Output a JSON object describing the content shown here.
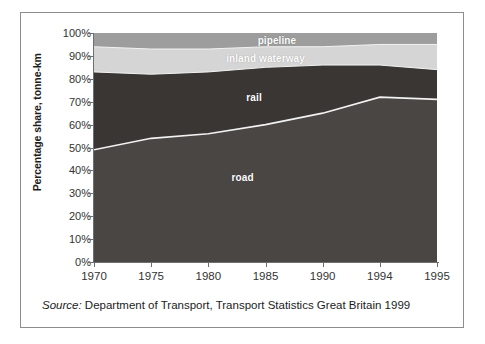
{
  "figure": {
    "background": "#ffffff",
    "frame_color": "#8d8d8d"
  },
  "axis": {
    "ylabel": "Percentage share, tonne-km",
    "ytick_labels": [
      "0%",
      "10%",
      "20%",
      "30%",
      "40%",
      "50%",
      "60%",
      "70%",
      "80%",
      "90%",
      "100%"
    ],
    "xtick_labels": [
      "1970",
      "1975",
      "1980",
      "1985",
      "1990",
      "1994",
      "1995"
    ]
  },
  "series_labels": {
    "pipeline": "pipeline",
    "waterway": "inland waterway",
    "rail": "rail",
    "road": "road"
  },
  "source": {
    "prefix": "Source:",
    "text": "Department of Transport, Transport Statistics Great Britain 1999"
  },
  "colors": {
    "road": "#4a4644",
    "rail": "#3a3634",
    "waterway": "#d5d5d5",
    "pipeline": "#9d9d9d",
    "boundary_line": "#f2f2f2",
    "axis": "#6f6f6f",
    "text": "#333333"
  },
  "chart_data": {
    "type": "area",
    "title": "",
    "subtitle": "",
    "xlabel": "",
    "ylabel": "Percentage share, tonne-km",
    "categories": [
      "1970",
      "1975",
      "1980",
      "1985",
      "1990",
      "1994",
      "1995"
    ],
    "x_spacing": "equal",
    "ylim": [
      0,
      100
    ],
    "yticks": [
      0,
      10,
      20,
      30,
      40,
      50,
      60,
      70,
      80,
      90,
      100
    ],
    "ytick_format": "percent",
    "grid": false,
    "legend": "inline-labels",
    "stacked": true,
    "stack_total": 100,
    "series": [
      {
        "name": "road",
        "color": "#4a4644",
        "values": [
          49,
          54,
          56,
          60,
          65,
          72,
          71
        ],
        "cumulative_top": [
          49,
          54,
          56,
          60,
          65,
          72,
          71
        ],
        "label_position": {
          "x": "1983",
          "y": 37
        }
      },
      {
        "name": "rail",
        "color": "#3a3634",
        "values": [
          34,
          28,
          27,
          25,
          21,
          14,
          13
        ],
        "cumulative_top": [
          83,
          82,
          83,
          85,
          86,
          86,
          84
        ],
        "label_position": {
          "x": "1984",
          "y": 72
        }
      },
      {
        "name": "inland waterway",
        "color": "#d5d5d5",
        "values": [
          11,
          11,
          10,
          9,
          8,
          9,
          11
        ],
        "cumulative_top": [
          94,
          93,
          93,
          94,
          94,
          95,
          95
        ],
        "label_position": {
          "x": "1985",
          "y": 89
        }
      },
      {
        "name": "pipeline",
        "color": "#9d9d9d",
        "values": [
          6,
          7,
          7,
          6,
          6,
          5,
          5
        ],
        "cumulative_top": [
          100,
          100,
          100,
          100,
          100,
          100,
          100
        ],
        "label_position": {
          "x": "1986",
          "y": 97
        }
      }
    ],
    "source_note": "Source: Department of Transport, Transport Statistics Great Britain 1999"
  }
}
